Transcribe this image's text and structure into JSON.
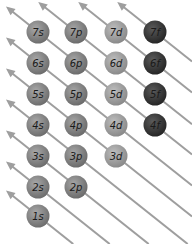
{
  "diagram": {
    "colors": {
      "arrow": "#9e9e9e",
      "s": "#8c8c8c",
      "p": "#8a8a8a",
      "d": "#a3a3a3",
      "f": "#3d3d3d",
      "label": "#1a1a1a"
    },
    "columns": [
      "s",
      "p",
      "d",
      "f"
    ],
    "orbitals": [
      {
        "label": "7s",
        "n": 7,
        "type": "s"
      },
      {
        "label": "7p",
        "n": 7,
        "type": "p"
      },
      {
        "label": "7d",
        "n": 7,
        "type": "d"
      },
      {
        "label": "7f",
        "n": 7,
        "type": "f"
      },
      {
        "label": "6s",
        "n": 6,
        "type": "s"
      },
      {
        "label": "6p",
        "n": 6,
        "type": "p"
      },
      {
        "label": "6d",
        "n": 6,
        "type": "d"
      },
      {
        "label": "6f",
        "n": 6,
        "type": "f"
      },
      {
        "label": "5s",
        "n": 5,
        "type": "s"
      },
      {
        "label": "5p",
        "n": 5,
        "type": "p"
      },
      {
        "label": "5d",
        "n": 5,
        "type": "d"
      },
      {
        "label": "5f",
        "n": 5,
        "type": "f"
      },
      {
        "label": "4s",
        "n": 4,
        "type": "s"
      },
      {
        "label": "4p",
        "n": 4,
        "type": "p"
      },
      {
        "label": "4d",
        "n": 4,
        "type": "d"
      },
      {
        "label": "4f",
        "n": 4,
        "type": "f"
      },
      {
        "label": "3s",
        "n": 3,
        "type": "s"
      },
      {
        "label": "3p",
        "n": 3,
        "type": "p"
      },
      {
        "label": "3d",
        "n": 3,
        "type": "d"
      },
      {
        "label": "2s",
        "n": 2,
        "type": "s"
      },
      {
        "label": "2p",
        "n": 2,
        "type": "p"
      },
      {
        "label": "1s",
        "n": 1,
        "type": "s"
      }
    ]
  }
}
